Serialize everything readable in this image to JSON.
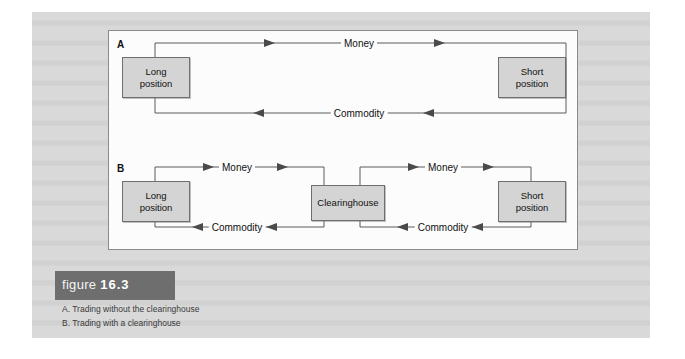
{
  "figure": {
    "caption_word": "figure",
    "caption_number": "16.3",
    "caption_lines": [
      "A. Trading without the clearinghouse",
      "B. Trading with a clearinghouse"
    ],
    "colors": {
      "page_background": "#d9d9d9",
      "panel_background": "#fcfcfc",
      "panel_border": "#8a8a8a",
      "node_fill": "#d4d4d4",
      "node_border": "#6f6f6f",
      "wire": "#5a5a5a",
      "caption_bar": "#6e6e6e",
      "caption_text": "#ffffff"
    }
  },
  "panels": [
    {
      "letter": "A",
      "nodes": [
        {
          "id": "long-position",
          "label": "Long\nposition"
        },
        {
          "id": "short-position",
          "label": "Short\nposition"
        }
      ],
      "flows": [
        {
          "id": "money",
          "label": "Money",
          "direction": "left-to-right"
        },
        {
          "id": "commodity",
          "label": "Commodity",
          "direction": "right-to-left"
        }
      ]
    },
    {
      "letter": "B",
      "nodes": [
        {
          "id": "long-position",
          "label": "Long\nposition"
        },
        {
          "id": "clearinghouse",
          "label": "Clearinghouse"
        },
        {
          "id": "short-position",
          "label": "Short\nposition"
        }
      ],
      "flows": [
        {
          "id": "money-left",
          "label": "Money",
          "direction": "left-to-right"
        },
        {
          "id": "money-right",
          "label": "Money",
          "direction": "left-to-right"
        },
        {
          "id": "commodity-left",
          "label": "Commodity",
          "direction": "right-to-left"
        },
        {
          "id": "commodity-right",
          "label": "Commodity",
          "direction": "right-to-left"
        }
      ]
    }
  ]
}
